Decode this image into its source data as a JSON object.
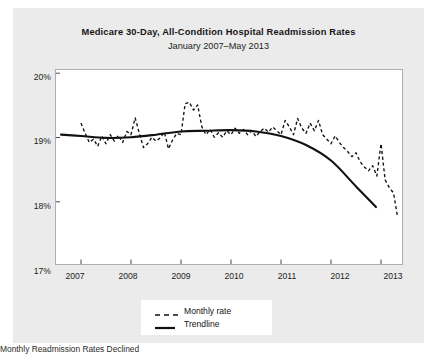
{
  "figure": {
    "title": "Medicare 30-Day, All-Condition Hospital Readmission Rates",
    "subtitle": "January 2007–May 2013",
    "caption": "Monthly Readmission Rates Declined",
    "background_color": "#ebebeb",
    "plot_background_color": "#ffffff",
    "line_color": "#111111"
  },
  "legend": {
    "position": "bottom-center",
    "entries": [
      {
        "label": "Monthly rate",
        "style": "dashed",
        "icon": "dashed-line-swatch"
      },
      {
        "label": "Trendline",
        "style": "solid",
        "icon": "solid-line-swatch"
      }
    ]
  },
  "chart_data": {
    "type": "line",
    "title": "Medicare 30-Day, All-Condition Hospital Readmission Rates",
    "subtitle": "January 2007–May 2013",
    "xlabel": "",
    "ylabel": "",
    "xlim": [
      2006.5,
      2013.42
    ],
    "ylim": [
      17,
      20
    ],
    "grid": false,
    "y_ticks": [
      17,
      18,
      19,
      20
    ],
    "y_tick_labels": [
      "17%",
      "18%",
      "19%",
      "20%"
    ],
    "x_ticks": [
      2007,
      2008,
      2009,
      2010,
      2011,
      2012,
      2013
    ],
    "x_tick_labels": [
      "2007",
      "2008",
      "2009",
      "2010",
      "2011",
      "2012",
      "2013"
    ],
    "series": [
      {
        "name": "Monthly rate",
        "style": "dashed",
        "x": [
          2007.0,
          2007.083,
          2007.167,
          2007.25,
          2007.333,
          2007.417,
          2007.5,
          2007.583,
          2007.667,
          2007.75,
          2007.833,
          2007.917,
          2008.0,
          2008.083,
          2008.167,
          2008.25,
          2008.333,
          2008.417,
          2008.5,
          2008.583,
          2008.667,
          2008.75,
          2008.833,
          2008.917,
          2009.0,
          2009.083,
          2009.167,
          2009.25,
          2009.333,
          2009.417,
          2009.5,
          2009.583,
          2009.667,
          2009.75,
          2009.833,
          2009.917,
          2010.0,
          2010.083,
          2010.167,
          2010.25,
          2010.333,
          2010.417,
          2010.5,
          2010.583,
          2010.667,
          2010.75,
          2010.833,
          2010.917,
          2011.0,
          2011.083,
          2011.167,
          2011.25,
          2011.333,
          2011.417,
          2011.5,
          2011.583,
          2011.667,
          2011.75,
          2011.833,
          2011.917,
          2012.0,
          2012.083,
          2012.167,
          2012.25,
          2012.333,
          2012.417,
          2012.5,
          2012.583,
          2012.667,
          2012.75,
          2012.833,
          2012.917,
          2013.0,
          2013.083,
          2013.167,
          2013.25,
          2013.333
        ],
        "values": [
          19.18,
          19.02,
          18.88,
          18.93,
          18.82,
          18.98,
          18.86,
          19.0,
          18.9,
          18.99,
          18.88,
          19.05,
          19.0,
          19.26,
          19.02,
          18.8,
          18.86,
          18.96,
          18.9,
          18.95,
          19.04,
          18.78,
          18.92,
          19.02,
          19.0,
          19.48,
          19.5,
          19.38,
          19.46,
          19.12,
          19.0,
          19.08,
          18.96,
          19.03,
          18.96,
          19.06,
          19.0,
          19.1,
          19.02,
          19.08,
          19.0,
          19.06,
          18.97,
          19.05,
          19.1,
          19.04,
          19.12,
          19.06,
          19.0,
          19.22,
          19.12,
          19.0,
          19.25,
          19.1,
          19.02,
          19.18,
          19.06,
          19.22,
          19.0,
          18.93,
          18.86,
          18.98,
          18.88,
          18.8,
          18.74,
          18.66,
          18.72,
          18.58,
          18.5,
          18.44,
          18.52,
          18.36,
          18.86,
          18.3,
          18.18,
          18.1,
          17.72
        ]
      },
      {
        "name": "Trendline",
        "style": "solid",
        "x": [
          2006.6,
          2007.0,
          2007.5,
          2008.0,
          2008.5,
          2009.0,
          2009.5,
          2010.0,
          2010.5,
          2011.0,
          2011.5,
          2012.0,
          2012.5,
          2012.9
        ],
        "values": [
          19.0,
          18.98,
          18.95,
          18.96,
          19.0,
          19.05,
          19.06,
          19.07,
          19.05,
          18.98,
          18.84,
          18.6,
          18.2,
          17.88
        ]
      }
    ]
  }
}
